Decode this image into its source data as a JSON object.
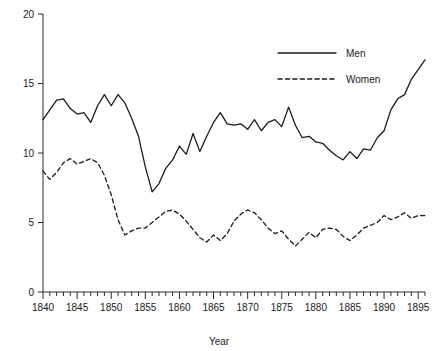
{
  "chart_data": {
    "type": "line",
    "title": "",
    "xlabel": "Year",
    "ylabel": "",
    "xlim": [
      1840,
      1896
    ],
    "ylim": [
      0,
      20
    ],
    "grid": false,
    "legend_position": "top-right",
    "x_ticks_major": [
      1840,
      1845,
      1850,
      1855,
      1860,
      1865,
      1870,
      1875,
      1880,
      1885,
      1890,
      1895
    ],
    "x_tick_labels": [
      "1840",
      "1845",
      "1850",
      "1855",
      "1860",
      "1865",
      "1870",
      "1875",
      "1880",
      "1885",
      "1890",
      "1895"
    ],
    "x_minor_tick_step": 1,
    "y_ticks": [
      0,
      5,
      10,
      15,
      20
    ],
    "y_tick_labels": [
      "0",
      "5",
      "10",
      "15",
      "20"
    ],
    "x": [
      1840,
      1841,
      1842,
      1843,
      1844,
      1845,
      1846,
      1847,
      1848,
      1849,
      1850,
      1851,
      1852,
      1853,
      1854,
      1855,
      1856,
      1857,
      1858,
      1859,
      1860,
      1861,
      1862,
      1863,
      1864,
      1865,
      1866,
      1867,
      1868,
      1869,
      1870,
      1871,
      1872,
      1873,
      1874,
      1875,
      1876,
      1877,
      1878,
      1879,
      1880,
      1881,
      1882,
      1883,
      1884,
      1885,
      1886,
      1887,
      1888,
      1889,
      1890,
      1891,
      1892,
      1893,
      1894,
      1895,
      1896
    ],
    "series": [
      {
        "name": "Men",
        "style": "solid",
        "color": "#1a1a1a",
        "values": [
          12.4,
          13.1,
          13.8,
          13.9,
          13.2,
          12.8,
          12.9,
          12.2,
          13.4,
          14.2,
          13.4,
          14.2,
          13.6,
          12.5,
          11.2,
          9.0,
          7.2,
          7.8,
          8.9,
          9.5,
          10.5,
          9.9,
          11.4,
          10.1,
          11.2,
          12.2,
          12.9,
          12.1,
          12.0,
          12.1,
          11.7,
          12.4,
          11.6,
          12.2,
          12.4,
          11.9,
          13.3,
          12.0,
          11.1,
          11.2,
          10.8,
          10.7,
          10.2,
          9.8,
          9.5,
          10.1,
          9.6,
          10.3,
          10.2,
          11.1,
          11.6,
          13.1,
          13.9,
          14.2,
          15.3,
          16.0,
          16.7
        ]
      },
      {
        "name": "Women",
        "style": "dashed",
        "color": "#1a1a1a",
        "values": [
          8.7,
          8.1,
          8.6,
          9.3,
          9.6,
          9.2,
          9.4,
          9.6,
          9.3,
          8.4,
          7.0,
          5.2,
          4.1,
          4.4,
          4.6,
          4.6,
          5.0,
          5.4,
          5.8,
          5.9,
          5.6,
          5.1,
          4.5,
          3.9,
          3.6,
          4.1,
          3.7,
          4.2,
          5.1,
          5.6,
          5.9,
          5.7,
          5.2,
          4.6,
          4.2,
          4.4,
          3.8,
          3.3,
          3.8,
          4.3,
          3.9,
          4.5,
          4.6,
          4.5,
          4.0,
          3.7,
          4.1,
          4.6,
          4.8,
          5.0,
          5.5,
          5.2,
          5.4,
          5.7,
          5.3,
          5.5,
          5.5
        ]
      }
    ]
  },
  "legend": {
    "entries": [
      {
        "label": "Men",
        "style": "solid"
      },
      {
        "label": "Women",
        "style": "dashed"
      }
    ]
  },
  "axes": {
    "x_title": "Year",
    "y_title": ""
  }
}
